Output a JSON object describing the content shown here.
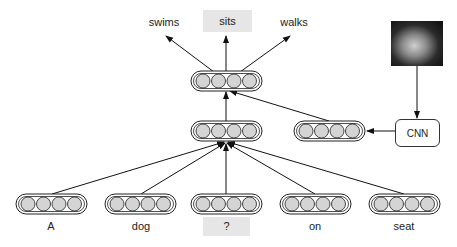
{
  "outputs": [
    {
      "label": "swims",
      "highlight": false
    },
    {
      "label": "sits",
      "highlight": true
    },
    {
      "label": "walks",
      "highlight": false
    }
  ],
  "inputs": [
    {
      "label": "A",
      "highlight": false
    },
    {
      "label": "dog",
      "highlight": false
    },
    {
      "label": "?",
      "highlight": true
    },
    {
      "label": "on",
      "highlight": false
    },
    {
      "label": "seat",
      "highlight": false
    }
  ],
  "cnn": {
    "label": "CNN"
  },
  "image": {
    "description": "photo of a dog lying down"
  },
  "colors": {
    "node_fill": "#d4d4d4",
    "stroke": "#222222",
    "highlight_bg": "#e6e6e6"
  }
}
